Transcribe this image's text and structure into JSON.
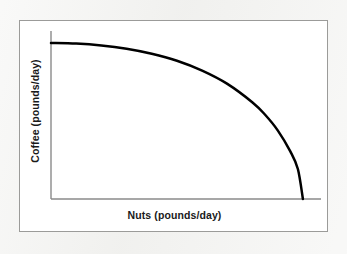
{
  "figure": {
    "background_color": "#f2f2f0",
    "panel_color": "#ffffff",
    "frame_color": "#9b9b99",
    "axis_color": "#8a8a8a",
    "curve_color": "#000000"
  },
  "labels": {
    "y_axis_title": "Coffee (pounds/day)",
    "x_axis_title": "Nuts (pounds/day)"
  },
  "chart_data": {
    "type": "line",
    "title": "",
    "subtitle": "",
    "xlabel": "Nuts (pounds/day)",
    "ylabel": "Coffee (pounds/day)",
    "xlim": [
      0,
      110
    ],
    "ylim": [
      0,
      110
    ],
    "grid": false,
    "legend": false,
    "legend_position": "none",
    "axis_ticks": {
      "x": [],
      "y": []
    },
    "annotations": [],
    "series": [
      {
        "name": "Production possibilities frontier",
        "description": "Concave-to-origin production possibilities frontier: flat near the vertical axis, bowing outward, then falling steeply to the horizontal axis.",
        "style": "solid",
        "line_width": 2.5,
        "color": "#000000",
        "x": [
          0,
          10,
          20,
          30,
          40,
          50,
          60,
          70,
          80,
          85,
          90,
          95,
          98,
          100
        ],
        "y": [
          100,
          99.6,
          98.4,
          96.3,
          93.1,
          88.6,
          82.3,
          73.8,
          61.9,
          54.0,
          44.0,
          30.5,
          19.2,
          0
        ]
      }
    ]
  }
}
